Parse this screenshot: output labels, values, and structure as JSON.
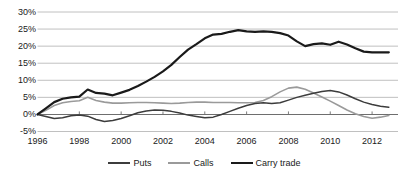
{
  "chart_data": {
    "type": "line",
    "title": "",
    "xlabel": "",
    "ylabel": "",
    "xlim": [
      1996,
      2013
    ],
    "ylim": [
      -5,
      30
    ],
    "grid": true,
    "legend_position": "bottom",
    "y_ticks": [
      "30%",
      "25%",
      "20%",
      "15%",
      "10%",
      "5%",
      "0%",
      "-5%"
    ],
    "y_tick_values": [
      30,
      25,
      20,
      15,
      10,
      5,
      0,
      -5
    ],
    "x_ticks": [
      "1996",
      "1998",
      "2000",
      "2002",
      "2004",
      "2006",
      "2008",
      "2010",
      "2012"
    ],
    "x_tick_values": [
      1996,
      1998,
      2000,
      2002,
      2004,
      2006,
      2008,
      2010,
      2012
    ],
    "x": [
      1996.0,
      1996.4,
      1996.8,
      1997.2,
      1997.6,
      1998.0,
      1998.4,
      1998.8,
      1999.2,
      1999.6,
      2000.0,
      2000.4,
      2000.8,
      2001.2,
      2001.6,
      2002.0,
      2002.4,
      2002.8,
      2003.2,
      2003.6,
      2004.0,
      2004.4,
      2004.8,
      2005.2,
      2005.6,
      2006.0,
      2006.4,
      2006.8,
      2007.2,
      2007.6,
      2008.0,
      2008.4,
      2008.8,
      2009.2,
      2009.6,
      2010.0,
      2010.4,
      2010.8,
      2011.2,
      2011.6,
      2012.0,
      2012.4,
      2012.8
    ],
    "series": [
      {
        "name": "Carry trade",
        "color": "#1a1a1a",
        "width": 2.2,
        "values": [
          0.0,
          1.8,
          3.6,
          4.6,
          5.0,
          5.2,
          7.3,
          6.3,
          6.1,
          5.6,
          6.4,
          7.2,
          8.3,
          9.6,
          11.0,
          12.6,
          14.5,
          16.8,
          19.0,
          20.6,
          22.3,
          23.4,
          23.6,
          24.2,
          24.7,
          24.3,
          24.2,
          24.3,
          24.2,
          23.8,
          23.1,
          21.4,
          20.0,
          20.6,
          20.8,
          20.4,
          21.3,
          20.5,
          19.4,
          18.4,
          18.2,
          18.2,
          18.2
        ]
      },
      {
        "name": "Puts",
        "color": "#3c3c3c",
        "width": 1.5,
        "values": [
          0.0,
          -0.6,
          -1.2,
          -1.0,
          -0.4,
          -0.2,
          -0.5,
          -1.5,
          -2.1,
          -1.8,
          -1.2,
          -0.4,
          0.5,
          1.0,
          1.3,
          1.2,
          0.9,
          0.4,
          -0.2,
          -0.6,
          -1.0,
          -0.8,
          0.0,
          0.9,
          1.8,
          2.6,
          3.2,
          3.4,
          3.2,
          3.4,
          4.2,
          5.0,
          5.6,
          6.2,
          6.7,
          7.0,
          6.6,
          5.7,
          4.6,
          3.6,
          2.9,
          2.4,
          2.1
        ]
      },
      {
        "name": "Calls",
        "color": "#9a9a9a",
        "width": 1.6,
        "values": [
          0.0,
          1.2,
          2.6,
          3.4,
          3.8,
          4.0,
          5.0,
          4.1,
          3.6,
          3.3,
          3.3,
          3.4,
          3.5,
          3.5,
          3.4,
          3.3,
          3.2,
          3.3,
          3.5,
          3.6,
          3.6,
          3.5,
          3.5,
          3.5,
          3.4,
          3.4,
          3.5,
          4.1,
          5.2,
          6.6,
          7.7,
          8.0,
          7.4,
          6.3,
          5.1,
          3.9,
          2.6,
          1.3,
          0.2,
          -0.6,
          -1.1,
          -0.8,
          -0.3
        ]
      }
    ],
    "legend": [
      {
        "label": "Puts",
        "color": "#3c3c3c",
        "width": 2.2
      },
      {
        "label": "Calls",
        "color": "#9a9a9a",
        "width": 2.2
      },
      {
        "label": "Carry trade",
        "color": "#1a1a1a",
        "width": 2.6
      }
    ],
    "axis_colors": {
      "grid": "#b9b9b9",
      "zero_line": "#6e6e6e",
      "text": "#1a1a1a"
    }
  }
}
